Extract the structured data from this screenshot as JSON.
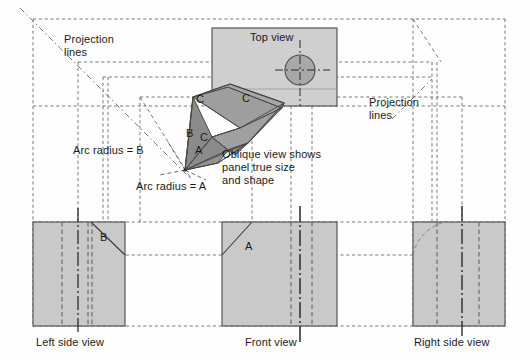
{
  "drawing": {
    "title": "Orthographic projection with oblique auxiliary view",
    "colors": {
      "panel_fill": "#c9c9c9",
      "panel_fill_light": "#cfcfcf",
      "facet_dark": "#8f8f8f",
      "facet_mid": "#a5a5a5",
      "facet_light": "#bdbdbd",
      "outline": "#4a4a4a",
      "hidden_line": "#5a5a5a",
      "center_line": "#2b2b2b",
      "projection_line": "#6b6b6b",
      "text": "#1a1a1a",
      "background": "#fefefe"
    }
  },
  "labels": {
    "projection_lines_left": "Projection\nlines",
    "projection_lines_right": "Projection\nlines",
    "top_view": "Top view",
    "left_side_view": "Left side view",
    "front_view": "Front view",
    "right_side_view": "Right side view",
    "arc_radius_b": "Arc radius = B",
    "arc_radius_a": "Arc radius = A",
    "oblique_note": "Oblique view shows\npanel true size\nand shape"
  },
  "annotations": {
    "oblique_a": "A",
    "oblique_b": "B",
    "oblique_c_inner": "C",
    "oblique_c_top": "C",
    "top_view_c": "C",
    "left_view_b": "B",
    "front_view_a": "A"
  },
  "views": [
    {
      "name": "top-view",
      "label": "Top view",
      "x": 212,
      "y": 28,
      "width": 125,
      "height": 78,
      "features": [
        "rectangular-panel",
        "circular-hole",
        "center-lines",
        "edge-C"
      ]
    },
    {
      "name": "left-side-view",
      "label": "Left side view",
      "x": 33,
      "y": 222,
      "width": 92,
      "height": 104,
      "features": [
        "rectangular-panel",
        "chamfer-B",
        "hidden-lines",
        "center-line"
      ]
    },
    {
      "name": "front-view",
      "label": "Front view",
      "x": 222,
      "y": 222,
      "width": 115,
      "height": 104,
      "features": [
        "rectangular-panel",
        "chamfer-A",
        "hidden-lines",
        "center-line"
      ]
    },
    {
      "name": "right-side-view",
      "label": "Right side view",
      "x": 413,
      "y": 222,
      "width": 92,
      "height": 104,
      "features": [
        "rectangular-panel",
        "hidden-arc",
        "hidden-lines",
        "center-line"
      ]
    },
    {
      "name": "oblique-view",
      "label": "Oblique view",
      "features": [
        "faceted-panel",
        "true-size-face-A",
        "face-B",
        "face-C"
      ]
    }
  ]
}
